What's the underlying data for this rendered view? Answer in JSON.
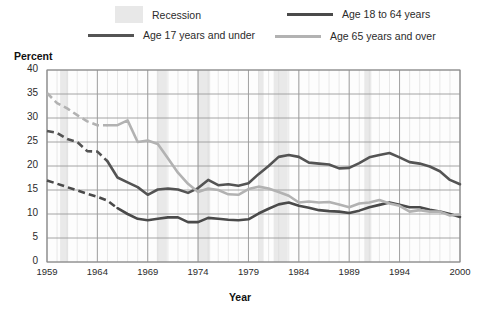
{
  "legend": {
    "items": [
      {
        "key": "recession",
        "label": "Recession",
        "type": "box",
        "color": "#e8e8e8"
      },
      {
        "key": "age18to64",
        "label": "Age 18 to 64 years",
        "type": "line",
        "color": "#4a4a4a"
      },
      {
        "key": "age17under",
        "label": "Age 17 years and under",
        "type": "line",
        "color": "#545454"
      },
      {
        "key": "age65over",
        "label": "Age 65 years and over",
        "type": "line",
        "color": "#b2b2b2"
      }
    ]
  },
  "axis": {
    "ylabel": "Percent",
    "xlabel": "Year",
    "yticks": [
      "0",
      "5",
      "10",
      "15",
      "20",
      "25",
      "30",
      "35",
      "40"
    ],
    "xticks": [
      "1959",
      "1964",
      "1969",
      "1974",
      "1979",
      "1984",
      "1989",
      "1994",
      "2000"
    ]
  },
  "chart_data": {
    "type": "line",
    "title": "",
    "xlabel": "Year",
    "ylabel": "Percent",
    "xlim": [
      1959,
      2000
    ],
    "ylim": [
      0,
      40
    ],
    "ytick_step": 5,
    "grid": true,
    "legend_position": "top",
    "x": [
      1959,
      1960,
      1961,
      1962,
      1963,
      1964,
      1965,
      1966,
      1967,
      1968,
      1969,
      1970,
      1971,
      1972,
      1973,
      1974,
      1975,
      1976,
      1977,
      1978,
      1979,
      1980,
      1981,
      1982,
      1983,
      1984,
      1985,
      1986,
      1987,
      1988,
      1989,
      1990,
      1991,
      1992,
      1993,
      1994,
      1995,
      1996,
      1997,
      1998,
      1999,
      2000
    ],
    "series": [
      {
        "name": "Age 17 years and under",
        "color": "#545454",
        "dashed_until": 1965,
        "values": [
          27.3,
          26.9,
          25.6,
          25.0,
          23.1,
          23.0,
          21.0,
          17.6,
          16.6,
          15.6,
          14.0,
          15.1,
          15.3,
          15.1,
          14.4,
          15.4,
          17.1,
          16.0,
          16.2,
          15.9,
          16.4,
          18.3,
          20.0,
          21.9,
          22.3,
          21.9,
          20.7,
          20.5,
          20.3,
          19.5,
          19.6,
          20.6,
          21.8,
          22.3,
          22.7,
          21.8,
          20.8,
          20.5,
          19.9,
          18.9,
          17.1,
          16.2
        ]
      },
      {
        "name": "Age 18 to 64 years",
        "color": "#4a4a4a",
        "dashed_until": 1966,
        "values": [
          17.0,
          16.3,
          15.6,
          14.9,
          14.2,
          13.6,
          12.8,
          11.2,
          10.0,
          9.0,
          8.7,
          9.0,
          9.3,
          9.3,
          8.3,
          8.3,
          9.2,
          9.0,
          8.8,
          8.7,
          8.9,
          10.1,
          11.1,
          12.0,
          12.4,
          11.7,
          11.3,
          10.8,
          10.6,
          10.5,
          10.2,
          10.7,
          11.4,
          11.9,
          12.4,
          11.9,
          11.4,
          11.4,
          10.9,
          10.5,
          10.0,
          9.4
        ]
      },
      {
        "name": "Age 65 years and over",
        "color": "#b2b2b2",
        "dashed_until": 1965,
        "values": [
          35.2,
          33.1,
          32.0,
          30.6,
          29.3,
          28.5,
          28.5,
          28.5,
          29.5,
          25.0,
          25.3,
          24.6,
          21.6,
          18.6,
          16.3,
          14.6,
          15.3,
          15.0,
          14.1,
          14.0,
          15.2,
          15.7,
          15.3,
          14.6,
          13.8,
          12.4,
          12.6,
          12.4,
          12.5,
          12.0,
          11.4,
          12.2,
          12.4,
          12.9,
          12.2,
          11.7,
          10.5,
          10.8,
          10.5,
          10.5,
          9.7,
          9.9
        ]
      }
    ],
    "recessions": [
      {
        "start": 1960.3,
        "end": 1961.1
      },
      {
        "start": 1969.9,
        "end": 1970.9
      },
      {
        "start": 1973.9,
        "end": 1975.2
      },
      {
        "start": 1980.0,
        "end": 1980.5
      },
      {
        "start": 1981.5,
        "end": 1982.9
      },
      {
        "start": 1990.5,
        "end": 1991.2
      }
    ]
  }
}
